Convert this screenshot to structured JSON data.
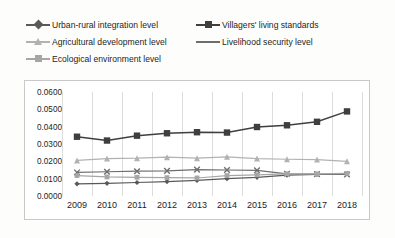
{
  "chart_data": {
    "type": "line",
    "title": "",
    "xlabel": "",
    "ylabel": "",
    "categories": [
      "2009",
      "2010",
      "2011",
      "2012",
      "2013",
      "2014",
      "2015",
      "2016",
      "2017",
      "2018"
    ],
    "ylim": [
      0.0,
      0.06
    ],
    "ytick_labels": [
      "0.0000",
      "0.0100",
      "0.0200",
      "0.0300",
      "0.0400",
      "0.0500",
      "0.0600"
    ],
    "ytick_values": [
      0.0,
      0.01,
      0.02,
      0.03,
      0.04,
      0.05,
      0.06
    ],
    "grid": "vertical",
    "legend_position": "top",
    "series": [
      {
        "name": "Urban-rural integration level",
        "marker": "diamond",
        "color": "#595959",
        "values": [
          0.007,
          0.0073,
          0.0078,
          0.0083,
          0.009,
          0.01,
          0.0108,
          0.012,
          0.0124,
          0.0128
        ]
      },
      {
        "name": "Villagers' living standards",
        "marker": "square",
        "color": "#3f3f3f",
        "values": [
          0.0342,
          0.032,
          0.0348,
          0.0362,
          0.0368,
          0.0366,
          0.0398,
          0.0408,
          0.0428,
          0.0488
        ]
      },
      {
        "name": "Agricultural development level",
        "marker": "triangle",
        "color": "#b2b2b2",
        "values": [
          0.0205,
          0.0216,
          0.0218,
          0.0224,
          0.0218,
          0.0226,
          0.0216,
          0.0212,
          0.021,
          0.02
        ]
      },
      {
        "name": "Livelihood security level",
        "marker": "cross",
        "color": "#6e6e6e",
        "values": [
          0.0136,
          0.014,
          0.0143,
          0.0145,
          0.0152,
          0.015,
          0.0148,
          0.0128,
          0.0126,
          0.0124
        ]
      },
      {
        "name": "Ecological environment level",
        "marker": "square-small",
        "color": "#a6a6a6",
        "values": [
          0.0118,
          0.011,
          0.0108,
          0.0106,
          0.0104,
          0.0118,
          0.0122,
          0.0128,
          0.0128,
          0.013
        ]
      }
    ]
  },
  "legend": {
    "items": [
      {
        "label": "Urban-rural integration level"
      },
      {
        "label": "Villagers' living standards"
      },
      {
        "label": "Agricultural development level"
      },
      {
        "label": "Livelihood security level"
      },
      {
        "label": "Ecological environment level"
      }
    ]
  }
}
